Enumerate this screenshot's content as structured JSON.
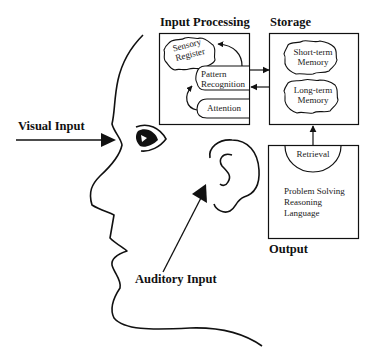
{
  "sections": {
    "input_processing": {
      "title": "Input Processing",
      "sensory_register": [
        "Sensory",
        "Register"
      ],
      "pattern_recognition": [
        "Pattern",
        "Recognition"
      ],
      "attention": "Attention"
    },
    "storage": {
      "title": "Storage",
      "short_term": [
        "Short-term",
        "Memory"
      ],
      "long_term": [
        "Long-term",
        "Memory"
      ]
    },
    "output": {
      "title": "Output",
      "retrieval": "Retrieval",
      "functions": [
        "Problem Solving",
        "Reasoning",
        "Language"
      ]
    }
  },
  "inputs": {
    "visual": "Visual Input",
    "auditory": "Auditory Input"
  },
  "colors": {
    "line": "#111111",
    "background": "#ffffff"
  }
}
